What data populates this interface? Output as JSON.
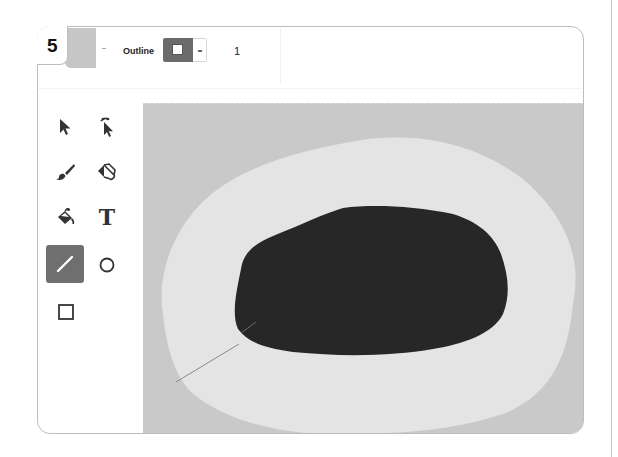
{
  "step": {
    "number": "5"
  },
  "toolbar": {
    "fill": {
      "color": "#c6c6c6",
      "label": "Fill"
    },
    "outline": {
      "label": "Outline",
      "color": "#6b6b6b"
    },
    "stroke_width": "1"
  },
  "tools": [
    {
      "id": "select",
      "icon": "arrow-pointer-icon",
      "selected": false
    },
    {
      "id": "reshape",
      "icon": "reshape-pointer-icon",
      "selected": false
    },
    {
      "id": "brush",
      "icon": "brush-icon",
      "selected": false
    },
    {
      "id": "eraser",
      "icon": "eraser-icon",
      "selected": false
    },
    {
      "id": "fill",
      "icon": "paint-bucket-icon",
      "selected": false
    },
    {
      "id": "text",
      "icon": "text-icon",
      "glyph": "T",
      "selected": false
    },
    {
      "id": "line",
      "icon": "line-icon",
      "selected": true
    },
    {
      "id": "circle",
      "icon": "circle-icon",
      "selected": false
    },
    {
      "id": "rectangle",
      "icon": "rectangle-icon",
      "selected": false
    }
  ],
  "canvas": {
    "background": "#c9c9c9",
    "shapes": [
      {
        "type": "blob",
        "name": "outer-light-shape",
        "color": "#e3e3e3"
      },
      {
        "type": "blob",
        "name": "inner-dark-shape",
        "color": "#262626"
      },
      {
        "type": "line",
        "name": "drawn-line",
        "color": "#8a8a8a"
      }
    ]
  }
}
